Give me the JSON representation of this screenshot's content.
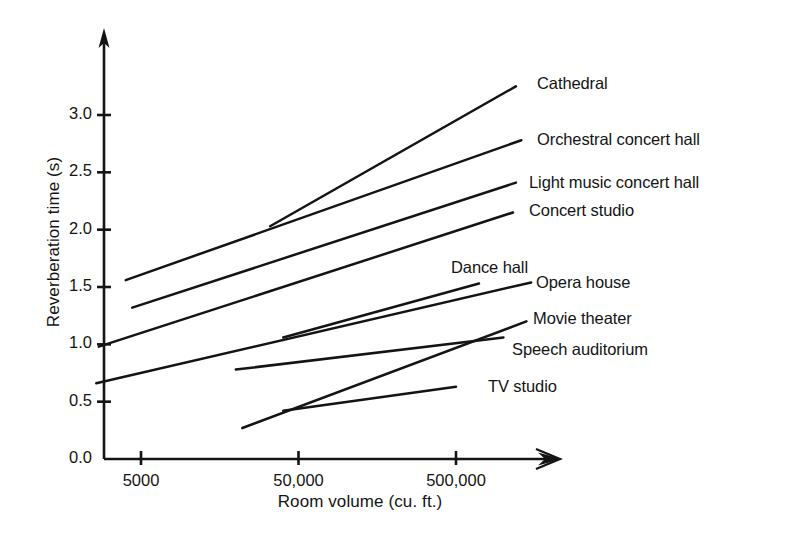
{
  "chart_data": {
    "type": "line",
    "title": "",
    "xlabel": "Room volume (cu. ft.)",
    "ylabel": "Reverberation time (s)",
    "x_scale": "log",
    "xlim": [
      2000,
      2000000
    ],
    "ylim": [
      0.0,
      3.5
    ],
    "xticks": [
      5000,
      50000,
      500000
    ],
    "xtick_labels": [
      "5000",
      "50,000",
      "500,000"
    ],
    "yticks": [
      0.0,
      0.5,
      1.0,
      1.5,
      2.0,
      2.5,
      3.0
    ],
    "ytick_labels": [
      "0.0",
      "0.5",
      "1.0",
      "1.5",
      "2.0",
      "2.5",
      "3.0"
    ],
    "grid": false,
    "legend_position": "inline-right-of-line-ends",
    "axis_arrows": true,
    "line_color": "#141414",
    "series": [
      {
        "name": "Cathedral",
        "label": "Cathedral",
        "x": [
          33000,
          1200000
        ],
        "y": [
          2.03,
          3.25
        ]
      },
      {
        "name": "Orchestral concert hall",
        "label": "Orchestral concert hall",
        "x": [
          4000,
          1300000
        ],
        "y": [
          1.56,
          2.78
        ]
      },
      {
        "name": "Light music concert hall",
        "label": "Light music concert hall",
        "x": [
          4400,
          1200000
        ],
        "y": [
          1.32,
          2.41
        ]
      },
      {
        "name": "Concert studio",
        "label": "Concert studio",
        "x": [
          2700,
          1150000
        ],
        "y": [
          0.98,
          2.15
        ]
      },
      {
        "name": "Dance hall",
        "label": "Dance hall",
        "x": [
          40000,
          700000
        ],
        "y": [
          1.06,
          1.53
        ]
      },
      {
        "name": "Opera house",
        "label": "Opera house",
        "x": [
          2600,
          1500000
        ],
        "y": [
          0.66,
          1.54
        ]
      },
      {
        "name": "Movie theater",
        "label": "Movie theater",
        "x": [
          22000,
          1400000
        ],
        "y": [
          0.27,
          1.2
        ]
      },
      {
        "name": "Speech auditorium",
        "label": "Speech auditorium",
        "x": [
          20000,
          1000000
        ],
        "y": [
          0.78,
          1.06
        ]
      },
      {
        "name": "TV studio",
        "label": "TV studio",
        "x": [
          40000,
          500000
        ],
        "y": [
          0.42,
          0.63
        ]
      }
    ]
  },
  "labels": {
    "series": [
      {
        "text": "Cathedral",
        "x": 537,
        "y": 74
      },
      {
        "text": "Orchestral concert hall",
        "x": 537,
        "y": 130
      },
      {
        "text": "Light music concert hall",
        "x": 529,
        "y": 173
      },
      {
        "text": "Concert studio",
        "x": 529,
        "y": 201
      },
      {
        "text": "Dance hall",
        "x": 451,
        "y": 258
      },
      {
        "text": "Opera house",
        "x": 536,
        "y": 273
      },
      {
        "text": "Movie theater",
        "x": 533,
        "y": 309
      },
      {
        "text": "Speech auditorium",
        "x": 512,
        "y": 340
      },
      {
        "text": "TV studio",
        "x": 488,
        "y": 377
      }
    ]
  }
}
